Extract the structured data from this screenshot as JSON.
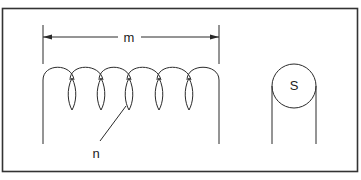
{
  "diagram": {
    "type": "coil-spring-diagram",
    "labels": {
      "length": "m",
      "coil_turn": "n",
      "cross_section": "S"
    },
    "colors": {
      "stroke": "#2a2a2a",
      "background": "#ffffff",
      "frame": "#333333"
    },
    "coil": {
      "turns": 6
    }
  }
}
